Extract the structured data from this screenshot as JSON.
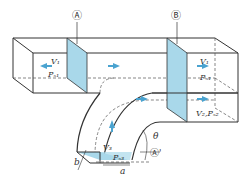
{
  "diagram": {
    "colors": {
      "line": "#333333",
      "section_fill": "#a9d8ea",
      "arrow": "#4aa3d0",
      "dashed": "#555555"
    },
    "labels": {
      "section_a": "Ⓐ",
      "section_b": "Ⓑ",
      "section_a_prime": "Ⓐ'",
      "v1_left": "V₁",
      "ps1_left": "Pₛ₁",
      "v1_right": "V₁",
      "ps1_right": "Pₛ₁",
      "v2_ps2": "V₂,Pₛ₂",
      "v3": "V₃",
      "ps3": "Pₛ₃",
      "theta": "θ",
      "dim_a": "a",
      "dim_b": "b"
    }
  }
}
